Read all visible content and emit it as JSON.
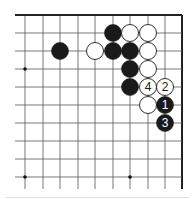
{
  "board": {
    "cols_x": [
      25,
      43,
      60,
      78,
      95,
      113,
      130,
      148,
      165,
      182
    ],
    "rows_y": [
      15,
      33,
      51,
      69,
      87,
      105,
      123,
      141,
      159,
      177
    ],
    "left_extent": 15,
    "bottom_extent": 189,
    "top_edge": true,
    "right_edge": true,
    "line_color": "#555555",
    "edge_color": "#222222",
    "stone_radius": 8.5
  },
  "star_points": [
    {
      "col": 0,
      "row": 3
    },
    {
      "col": 0,
      "row": 9
    },
    {
      "col": 6,
      "row": 9
    }
  ],
  "stones": [
    {
      "color": "black",
      "col": 5,
      "row": 1,
      "label": ""
    },
    {
      "color": "white",
      "col": 6,
      "row": 1,
      "label": ""
    },
    {
      "color": "white",
      "col": 7,
      "row": 1,
      "label": ""
    },
    {
      "color": "black",
      "col": 2,
      "row": 2,
      "label": ""
    },
    {
      "color": "white",
      "col": 4,
      "row": 2,
      "label": ""
    },
    {
      "color": "black",
      "col": 5,
      "row": 2,
      "label": ""
    },
    {
      "color": "black",
      "col": 6,
      "row": 2,
      "label": ""
    },
    {
      "color": "white",
      "col": 7,
      "row": 2,
      "label": ""
    },
    {
      "color": "black",
      "col": 6,
      "row": 3,
      "label": ""
    },
    {
      "color": "white",
      "col": 7,
      "row": 3,
      "label": ""
    },
    {
      "color": "black",
      "col": 6,
      "row": 4,
      "label": ""
    },
    {
      "color": "white",
      "col": 7,
      "row": 4,
      "label": "4"
    },
    {
      "color": "white",
      "col": 8,
      "row": 4,
      "label": "2"
    },
    {
      "color": "white",
      "col": 7,
      "row": 5,
      "label": ""
    },
    {
      "color": "black",
      "col": 8,
      "row": 5,
      "label": "1"
    },
    {
      "color": "black",
      "col": 8,
      "row": 6,
      "label": "3"
    }
  ]
}
